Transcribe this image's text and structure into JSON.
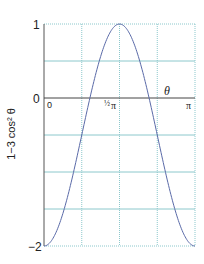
{
  "chart_data": {
    "type": "line",
    "title": "",
    "xlabel": "θ",
    "ylabel": "1−3 cos² θ",
    "xlim": [
      0,
      3.14159
    ],
    "ylim": [
      -2,
      1
    ],
    "x_ticks": [
      {
        "value": 0,
        "label": "0"
      },
      {
        "value": 1.5708,
        "label": "½π"
      },
      {
        "value": 3.14159,
        "label": "π"
      }
    ],
    "y_ticks": [
      {
        "value": 1,
        "label": "1"
      },
      {
        "value": 0,
        "label": "0"
      },
      {
        "value": -2,
        "label": "−2"
      }
    ],
    "grid": {
      "horizontal_step": 0.5,
      "vertical_step": 0.7854,
      "on": true
    },
    "series": [
      {
        "name": "1−3 cos² θ",
        "function": "1 - 3*cos(theta)^2",
        "x": [
          0,
          0.3927,
          0.7854,
          0.9553,
          1.1781,
          1.5708,
          1.9635,
          2.1863,
          2.3562,
          2.7489,
          3.14159
        ],
        "values": [
          -2,
          -1.56,
          -0.5,
          0,
          0.56,
          1,
          0.56,
          0,
          -0.5,
          -1.56,
          -2
        ]
      }
    ],
    "legend": null,
    "colors": {
      "curve": "#5a6aa8",
      "grid_solid": "#8cc8cc",
      "grid_dotted": "#8cc8cc",
      "axis": "#444444"
    }
  },
  "labels": {
    "y_top": "1",
    "y_zero": "0",
    "y_bottom": "−2",
    "x_zero": "0",
    "x_half_pi_frac": "½",
    "x_half_pi": "π",
    "x_pi": "π",
    "x_axis_var": "θ",
    "y_axis_label": "1−3 cos² θ"
  }
}
